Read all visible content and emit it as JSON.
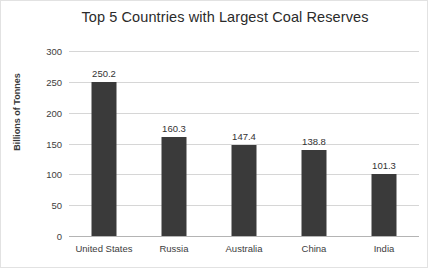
{
  "chart_data": {
    "type": "bar",
    "title": "Top 5 Countries with Largest Coal Reserves",
    "xlabel": "",
    "ylabel": "Billions of Tonnes",
    "categories": [
      "United States",
      "Russia",
      "Australia",
      "China",
      "India"
    ],
    "values": [
      250.2,
      160.3,
      147.4,
      138.8,
      101.3
    ],
    "value_labels": [
      "250.2",
      "160.3",
      "147.4",
      "138.8",
      "101.3"
    ],
    "ylim": [
      0,
      300
    ],
    "yticks": [
      300,
      250,
      200,
      150,
      100,
      50,
      0
    ],
    "ytick_labels": [
      "300",
      "250",
      "200",
      "150",
      "100",
      "50",
      "0"
    ],
    "grid": true,
    "legend": "none",
    "bar_color": "#3a3a3a",
    "gridline_color": "#d6d6d6",
    "background_color": "#ffffff"
  }
}
